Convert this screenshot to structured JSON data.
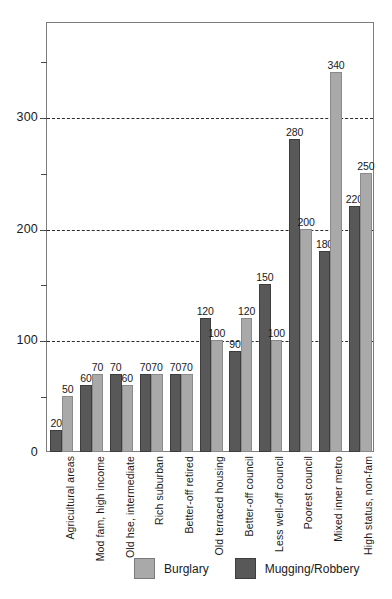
{
  "chart_data": {
    "type": "bar",
    "title": "",
    "subtitle": "",
    "xlabel": "",
    "ylabel": "",
    "ylim": [
      0,
      385
    ],
    "grid": true,
    "grid_values": [
      100,
      200,
      300
    ],
    "y_major_ticks": [
      "0",
      "100",
      "200",
      "300"
    ],
    "y_major_values": [
      0,
      100,
      200,
      300
    ],
    "y_minor_values": [
      50,
      150,
      250,
      350
    ],
    "legend_position": "bottom",
    "categories": [
      "Agricultural areas",
      "Mod fam, high income",
      "Old hse, intermediate",
      "Rich suburban",
      "Better-off retired",
      "Old terraced housing",
      "Better-off council",
      "Less well-off council",
      "Poorest council",
      "Mixed inner metro",
      "High status, non-fam"
    ],
    "series": [
      {
        "name": "Mugging/Robbery",
        "color": "#585858",
        "values": [
          20,
          60,
          70,
          70,
          70,
          120,
          90,
          150,
          280,
          180,
          220
        ]
      },
      {
        "name": "Burglary",
        "color": "#a9a9a9",
        "values": [
          50,
          70,
          60,
          70,
          70,
          100,
          120,
          100,
          200,
          340,
          250
        ]
      }
    ]
  },
  "legend": {
    "items": [
      {
        "label": "Burglary",
        "swatch": "light"
      },
      {
        "label": "Mugging/Robbery",
        "swatch": "dark"
      }
    ]
  }
}
